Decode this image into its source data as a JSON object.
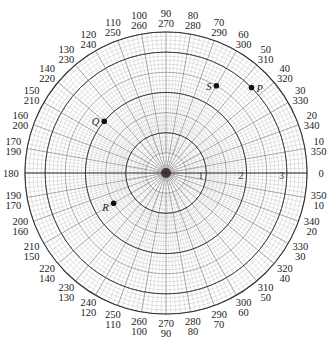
{
  "chart_data": {
    "type": "scatter",
    "subtype": "polar",
    "title": "",
    "center_px": [
      166,
      173
    ],
    "radius_px_per_unit": 40.3,
    "max_radius_units": 3.5,
    "radial_labels": [
      "1",
      "2",
      "3"
    ],
    "radial_major_rings": [
      1,
      2,
      3
    ],
    "angle_tick_step_deg": 10,
    "angle_labels_outer": [
      "0",
      "10",
      "20",
      "30",
      "40",
      "50",
      "60",
      "70",
      "80",
      "90",
      "100",
      "110",
      "120",
      "130",
      "140",
      "150",
      "160",
      "170",
      "180",
      "190",
      "200",
      "210",
      "220",
      "230",
      "240",
      "250",
      "260",
      "270",
      "280",
      "290",
      "300",
      "310",
      "320",
      "330",
      "340",
      "350"
    ],
    "angle_labels_inner": [
      "0",
      "350",
      "340",
      "330",
      "320",
      "310",
      "300",
      "290",
      "280",
      "270",
      "260",
      "250",
      "240",
      "230",
      "220",
      "210",
      "200",
      "190",
      "180",
      "170",
      "160",
      "150",
      "140",
      "130",
      "120",
      "110",
      "100",
      "90",
      "80",
      "70",
      "60",
      "50",
      "40",
      "30",
      "20",
      "10"
    ],
    "grid": true,
    "points": [
      {
        "name": "P",
        "r": 3,
        "theta_deg": 45
      },
      {
        "name": "S",
        "r": 2.5,
        "theta_deg": 60
      },
      {
        "name": "Q",
        "r": 2,
        "theta_deg": 140
      },
      {
        "name": "R",
        "r": 1.5,
        "theta_deg": 210
      }
    ],
    "colors": {
      "grid": "#555555",
      "points": "#111111",
      "background": "#ffffff"
    }
  }
}
